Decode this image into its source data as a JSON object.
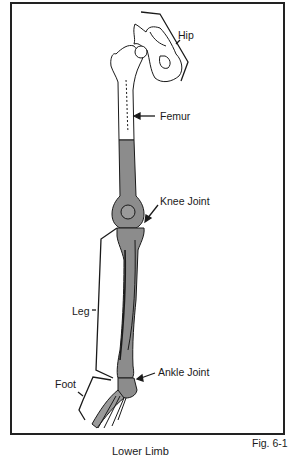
{
  "figure": {
    "id_label": "Fig. 6-1",
    "caption_partial": "Lower Limb",
    "labels": {
      "hip": "Hip",
      "femur": "Femur",
      "knee": "Knee Joint",
      "leg": "Leg",
      "ankle": "Ankle Joint",
      "foot": "Foot"
    },
    "colors": {
      "line": "#1a1a1a",
      "bone_fill": "#ffffff",
      "highlight_fill": "#8c8c8c",
      "frame": "#222222"
    }
  }
}
